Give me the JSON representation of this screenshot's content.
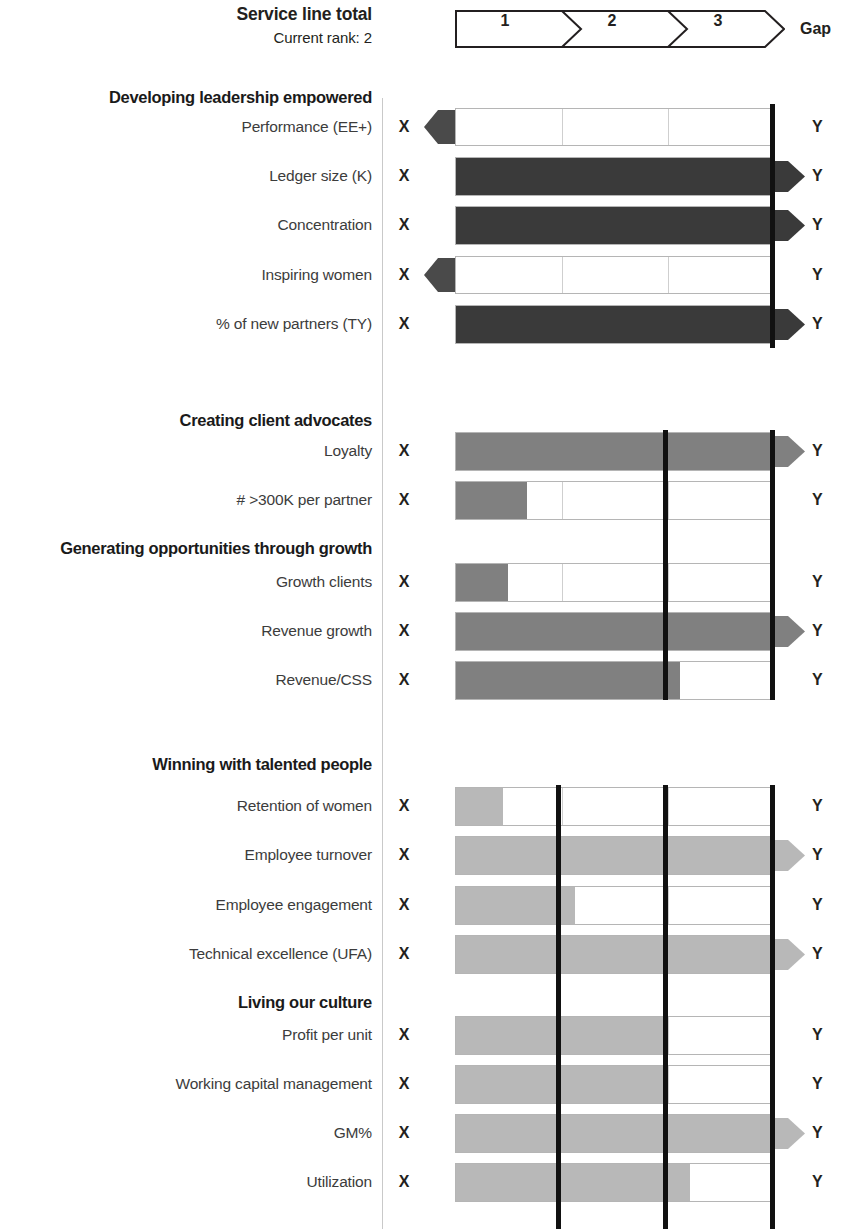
{
  "header": {
    "title": "Service line total",
    "subtitle": "Current rank: 2",
    "gap_label": "Gap",
    "segments": [
      "1",
      "2",
      "3"
    ]
  },
  "columns": {
    "x_marker": "X",
    "y_marker": "Y"
  },
  "colors": {
    "dark_bar": "#3a3a3a",
    "mid_bar": "#808080",
    "light_bar": "#b8b8b8",
    "target_line": "#111111",
    "grid_line": "#b5b5b5"
  },
  "groups": [
    {
      "label": "Developing leadership empowered",
      "metrics": [
        {
          "label": "Performance (EE+)",
          "x": "X",
          "y": "Y"
        },
        {
          "label": "Ledger size (K)",
          "x": "X",
          "y": "Y"
        },
        {
          "label": "Concentration",
          "x": "X",
          "y": "Y"
        },
        {
          "label": "Inspiring women",
          "x": "X",
          "y": "Y"
        },
        {
          "label": "% of new partners (TY)",
          "x": "X",
          "y": "Y"
        }
      ]
    },
    {
      "label": "Creating client advocates",
      "metrics": [
        {
          "label": "Loyalty",
          "x": "X",
          "y": "Y"
        },
        {
          "label": "# >300K per partner",
          "x": "X",
          "y": "Y"
        }
      ]
    },
    {
      "label": "Generating opportunities through growth",
      "metrics": [
        {
          "label": "Growth clients",
          "x": "X",
          "y": "Y"
        },
        {
          "label": "Revenue growth",
          "x": "X",
          "y": "Y"
        },
        {
          "label": "Revenue/CSS",
          "x": "X",
          "y": "Y"
        }
      ]
    },
    {
      "label": "Winning with talented people",
      "metrics": [
        {
          "label": "Retention of women",
          "x": "X",
          "y": "Y"
        },
        {
          "label": "Employee turnover",
          "x": "X",
          "y": "Y"
        },
        {
          "label": "Employee engagement",
          "x": "X",
          "y": "Y"
        },
        {
          "label": "Technical excellence (UFA)",
          "x": "X",
          "y": "Y"
        }
      ]
    },
    {
      "label": "Living our culture",
      "metrics": [
        {
          "label": "Profit per unit",
          "x": "X",
          "y": "Y"
        },
        {
          "label": "Working capital management",
          "x": "X",
          "y": "Y"
        },
        {
          "label": "GM%",
          "x": "X",
          "y": "Y"
        },
        {
          "label": "Utilization",
          "x": "X",
          "y": "Y"
        }
      ]
    }
  ],
  "chart_data": {
    "type": "bar",
    "title": "Service line total",
    "subtitle": "Current rank: 2",
    "xlabel": "",
    "ylabel": "",
    "orientation": "horizontal",
    "xlim": [
      0,
      3
    ],
    "x_axis_ticks": [
      "1",
      "2",
      "3"
    ],
    "grid": true,
    "legend": null,
    "note": "Horizontal bullet-bars scaled 0-3 across three rank segments; bold vertical line is the target/benchmark marker; arrow head means the bar overflows past the right edge; a left-pointing arrow at the origin means the value falls below the scale.",
    "categories": [
      "Performance (EE+)",
      "Ledger size (K)",
      "Concentration",
      "Inspiring women",
      "% of new partners (TY)",
      "Loyalty",
      "# >300K per partner",
      "Growth clients",
      "Revenue growth",
      "Revenue/CSS",
      "Retention of women",
      "Employee turnover",
      "Employee engagement",
      "Technical excellence (UFA)",
      "Profit per unit",
      "Working capital management",
      "GM%",
      "Utilization"
    ],
    "values": [
      0,
      3,
      3,
      0,
      3,
      3,
      0.67,
      0.5,
      3,
      2.1,
      0.45,
      3,
      1.1,
      3,
      1.95,
      1.95,
      3,
      2.2
    ],
    "shades": [
      "none",
      "dark",
      "dark",
      "none",
      "dark",
      "mid",
      "mid",
      "mid",
      "mid",
      "mid",
      "light",
      "light",
      "light",
      "light",
      "light",
      "light",
      "light",
      "light"
    ],
    "overflow_right": [
      false,
      true,
      true,
      false,
      true,
      true,
      false,
      false,
      true,
      false,
      false,
      true,
      false,
      true,
      false,
      false,
      true,
      false
    ],
    "underflow_left": [
      true,
      false,
      false,
      true,
      false,
      false,
      false,
      false,
      false,
      false,
      false,
      false,
      false,
      false,
      false,
      false,
      false,
      false
    ],
    "target_markers": {
      "Developing leadership empowered": [
        3
      ],
      "Creating client advocates": [
        2,
        3
      ],
      "Generating opportunities through growth": [
        2,
        3
      ],
      "Winning with talented people": [
        1,
        2,
        3
      ],
      "Living our culture": [
        1,
        2,
        3
      ]
    }
  },
  "layout": {
    "rows": [
      {
        "kind": "group",
        "group": 0,
        "label_y": 88,
        "label_h": 24
      },
      {
        "kind": "bar",
        "g": 0,
        "m": 0,
        "top": 108,
        "h": 38,
        "w": 0,
        "shade": "none",
        "right_arrow": false,
        "left_arrow": true,
        "label_y": 118
      },
      {
        "kind": "bar",
        "g": 0,
        "m": 1,
        "top": 157,
        "h": 39,
        "w": 320,
        "shade": "dark",
        "right_arrow": true,
        "left_arrow": false,
        "label_y": 167
      },
      {
        "kind": "bar",
        "g": 0,
        "m": 2,
        "top": 206,
        "h": 39,
        "w": 320,
        "shade": "dark",
        "right_arrow": true,
        "left_arrow": false,
        "label_y": 216
      },
      {
        "kind": "bar",
        "g": 0,
        "m": 3,
        "top": 256,
        "h": 38,
        "w": 0,
        "shade": "none",
        "right_arrow": false,
        "left_arrow": true,
        "label_y": 266
      },
      {
        "kind": "bar",
        "g": 0,
        "m": 4,
        "top": 305,
        "h": 39,
        "w": 320,
        "shade": "dark",
        "right_arrow": true,
        "left_arrow": false,
        "label_y": 315
      },
      {
        "kind": "spacer",
        "top": 344,
        "h": 88
      },
      {
        "kind": "group",
        "group": 1,
        "label_y": 411,
        "label_h": 24
      },
      {
        "kind": "bar",
        "g": 1,
        "m": 0,
        "top": 432,
        "h": 39,
        "w": 320,
        "shade": "mid",
        "right_arrow": true,
        "left_arrow": false,
        "label_y": 442
      },
      {
        "kind": "bar",
        "g": 1,
        "m": 1,
        "top": 481,
        "h": 39,
        "w": 72,
        "shade": "mid",
        "right_arrow": false,
        "left_arrow": false,
        "label_y": 491
      },
      {
        "kind": "group",
        "group": 2,
        "label_y": 539,
        "label_h": 24
      },
      {
        "kind": "bar",
        "g": 2,
        "m": 0,
        "top": 563,
        "h": 39,
        "w": 53,
        "shade": "mid",
        "right_arrow": false,
        "left_arrow": false,
        "label_y": 573
      },
      {
        "kind": "bar",
        "g": 2,
        "m": 1,
        "top": 612,
        "h": 39,
        "w": 320,
        "shade": "mid",
        "right_arrow": true,
        "left_arrow": false,
        "label_y": 622
      },
      {
        "kind": "bar",
        "g": 2,
        "m": 2,
        "top": 661,
        "h": 39,
        "w": 225,
        "shade": "mid",
        "right_arrow": false,
        "left_arrow": false,
        "label_y": 671
      },
      {
        "kind": "spacer",
        "top": 700,
        "h": 88
      },
      {
        "kind": "group",
        "group": 3,
        "label_y": 755,
        "label_h": 24
      },
      {
        "kind": "bar",
        "g": 3,
        "m": 0,
        "top": 787,
        "h": 39,
        "w": 48,
        "shade": "light",
        "right_arrow": false,
        "left_arrow": false,
        "label_y": 797
      },
      {
        "kind": "bar",
        "g": 3,
        "m": 1,
        "top": 836,
        "h": 39,
        "w": 320,
        "shade": "light",
        "right_arrow": true,
        "left_arrow": false,
        "label_y": 846
      },
      {
        "kind": "bar",
        "g": 3,
        "m": 2,
        "top": 886,
        "h": 39,
        "w": 120,
        "shade": "light",
        "right_arrow": false,
        "left_arrow": false,
        "label_y": 896
      },
      {
        "kind": "bar",
        "g": 3,
        "m": 3,
        "top": 935,
        "h": 39,
        "w": 320,
        "shade": "light",
        "right_arrow": true,
        "left_arrow": false,
        "label_y": 945
      },
      {
        "kind": "spacer",
        "top": 974,
        "h": 64
      },
      {
        "kind": "group",
        "group": 4,
        "label_y": 993,
        "label_h": 24
      },
      {
        "kind": "bar",
        "g": 4,
        "m": 0,
        "top": 1016,
        "h": 39,
        "w": 213,
        "shade": "light",
        "right_arrow": false,
        "left_arrow": false,
        "label_y": 1026
      },
      {
        "kind": "bar",
        "g": 4,
        "m": 1,
        "top": 1065,
        "h": 39,
        "w": 213,
        "shade": "light",
        "right_arrow": false,
        "left_arrow": false,
        "label_y": 1075
      },
      {
        "kind": "bar",
        "g": 4,
        "m": 2,
        "top": 1114,
        "h": 39,
        "w": 320,
        "shade": "light",
        "right_arrow": true,
        "left_arrow": false,
        "label_y": 1124
      },
      {
        "kind": "bar",
        "g": 4,
        "m": 3,
        "top": 1163,
        "h": 39,
        "w": 235,
        "shade": "light",
        "right_arrow": false,
        "left_arrow": false,
        "label_y": 1173
      }
    ],
    "targets": [
      {
        "left": 770,
        "top": 104,
        "h": 244
      },
      {
        "left": 663,
        "top": 430,
        "h": 270
      },
      {
        "left": 770,
        "top": 430,
        "h": 270
      },
      {
        "left": 556,
        "top": 785,
        "h": 444
      },
      {
        "left": 663,
        "top": 785,
        "h": 444
      },
      {
        "left": 770,
        "top": 785,
        "h": 444
      }
    ]
  }
}
